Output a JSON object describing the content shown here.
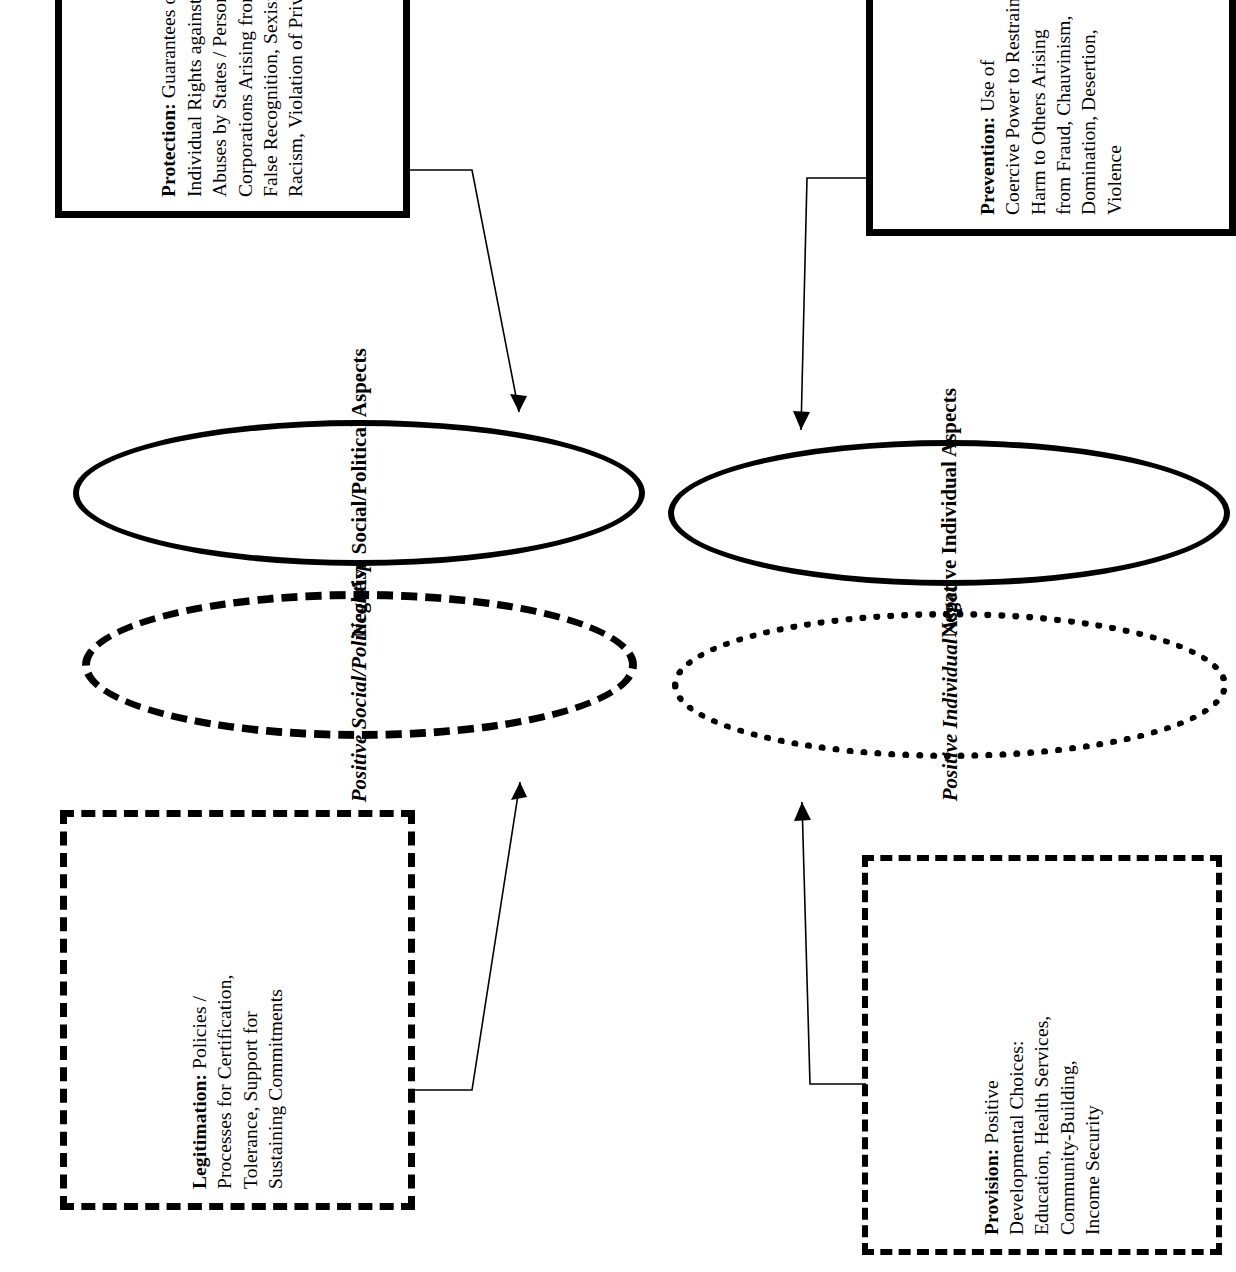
{
  "diagram": {
    "type": "concept-map",
    "orientation": "rotated-90-counterclockwise",
    "colors": {
      "stroke": "#000000",
      "background": "#ffffff",
      "text": "#000000"
    },
    "boxes": [
      {
        "id": "legitimation",
        "term": "Legitimation:",
        "body": " Policies / Processes for Certification, Tolerance, Support for Sustaining Commitments",
        "border_style": "dashed-coarse",
        "lines": [
          "Legitimation:  Policies /",
          "Processes for Certification,",
          "Tolerance, Support for",
          "Sustaining Commitments"
        ]
      },
      {
        "id": "protection",
        "term": "Protection:",
        "body": " Guarantees of Individual Rights against Abuses by States / Persons / Corporations Arising from False Recognition, Sexism, Racism, Violation of Privacy",
        "border_style": "solid-heavy",
        "lines": [
          "Protection: Guarantees of",
          "Individual Rights against",
          "Abuses by States / Persons /",
          "Corporations Arising from",
          "False Recognition, Sexism,",
          "Racism, Violation of Privacy"
        ]
      },
      {
        "id": "provision",
        "term": "Provision:",
        "body": " Positive Developmental Choices: Education, Health Services, Community-Building, Income Security",
        "border_style": "dashed-fine",
        "lines": [
          "Provision: Positive",
          "Developmental Choices:",
          "Education, Health Services,",
          "Community-Building,",
          "Income Security"
        ]
      },
      {
        "id": "prevention",
        "term": "Prevention:",
        "body": " Use of Coercive Power to Restrain Harm to Others Arising from Fraud, Chauvinism, Domination, Desertion, Violence",
        "border_style": "solid-heavy",
        "lines": [
          "Prevention: Use of",
          "Coercive Power to Restrain",
          "Harm to Others Arising",
          "from Fraud, Chauvinism,",
          "Domination, Desertion,",
          "Violence"
        ]
      }
    ],
    "ellipses": [
      {
        "id": "positive-social-political",
        "label": "Positive Social/Political Aspects",
        "border_style": "dashed",
        "text_style": "bold-italic"
      },
      {
        "id": "negative-social-political",
        "label": "Negative Social/Political Aspects",
        "border_style": "solid-heavy",
        "text_style": "bold"
      },
      {
        "id": "positive-individual",
        "label": "Positive Individual Aspects",
        "border_style": "dotted",
        "text_style": "bold-italic"
      },
      {
        "id": "negative-individual",
        "label": "Negative Individual Aspects",
        "border_style": "solid-heavy",
        "text_style": "bold"
      }
    ],
    "arrows": [
      {
        "id": "legitimation-to-positive-social",
        "from": "legitimation",
        "to": "positive-social-political",
        "direction": "right"
      },
      {
        "id": "protection-to-negative-social",
        "from": "protection",
        "to": "negative-social-political",
        "direction": "left"
      },
      {
        "id": "provision-to-positive-individual",
        "from": "provision",
        "to": "positive-individual",
        "direction": "right"
      },
      {
        "id": "prevention-to-negative-individual",
        "from": "prevention",
        "to": "negative-individual",
        "direction": "left"
      }
    ]
  }
}
